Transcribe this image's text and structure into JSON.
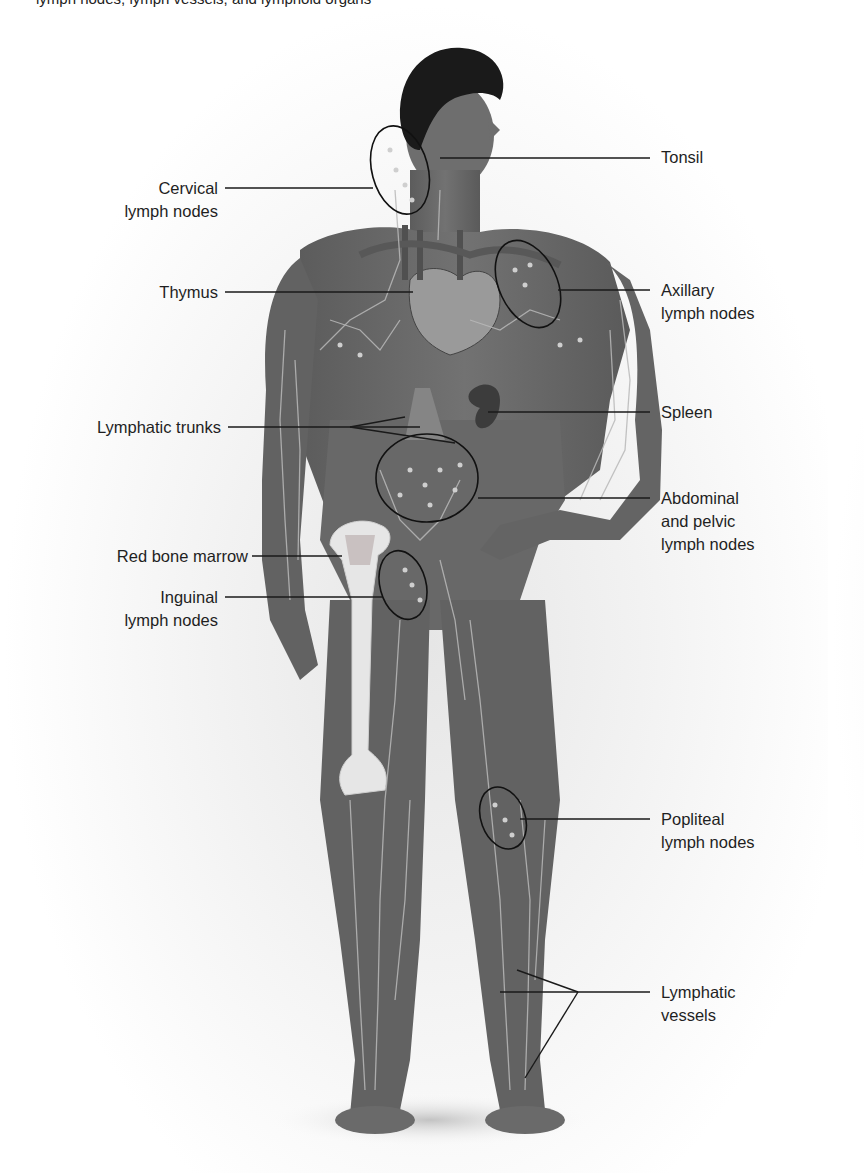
{
  "caption": "lymph nodes, lymph vessels, and lymphoid organs",
  "figure": {
    "colors": {
      "body": "#6a6a6a",
      "body_dark": "#555555",
      "hair": "#1a1a1a",
      "vessels": "#b9b9b9",
      "bone": "#e6e6e6",
      "leader_line": "#1a1a1a",
      "circle_stroke": "#111111"
    }
  },
  "labels": {
    "left": [
      {
        "id": "cervical",
        "lines": [
          "Cervical",
          "lymph nodes"
        ]
      },
      {
        "id": "thymus",
        "lines": [
          "Thymus"
        ]
      },
      {
        "id": "lymphatic_trunks",
        "lines": [
          "Lymphatic trunks"
        ]
      },
      {
        "id": "red_bone_marrow",
        "lines": [
          "Red bone marrow"
        ]
      },
      {
        "id": "inguinal",
        "lines": [
          "Inguinal",
          "lymph nodes"
        ]
      }
    ],
    "right": [
      {
        "id": "tonsil",
        "lines": [
          "Tonsil"
        ]
      },
      {
        "id": "axillary",
        "lines": [
          "Axillary",
          "lymph nodes"
        ]
      },
      {
        "id": "spleen",
        "lines": [
          "Spleen"
        ]
      },
      {
        "id": "abdominal_pelvic",
        "lines": [
          "Abdominal",
          "and pelvic",
          "lymph nodes"
        ]
      },
      {
        "id": "popliteal",
        "lines": [
          "Popliteal",
          "lymph nodes"
        ]
      },
      {
        "id": "lymphatic_vessels",
        "lines": [
          "Lymphatic",
          "vessels"
        ]
      }
    ]
  }
}
